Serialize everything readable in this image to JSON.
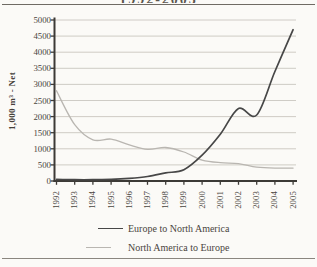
{
  "page": {
    "title_fragment": "1992-2005"
  },
  "chart_data": {
    "type": "line",
    "title_visible_fragment": "1992-2005",
    "ylabel": "1,000 m³ - Net",
    "ylim": [
      0,
      5000
    ],
    "yticks": [
      0,
      500,
      1000,
      1500,
      2000,
      2500,
      3000,
      3500,
      4000,
      4500,
      5000
    ],
    "ytick_labels": [
      "0",
      "500",
      "1000",
      "1500",
      "2000",
      "2500",
      "3000",
      "3500",
      "4000",
      "4500",
      "5000"
    ],
    "x": [
      1992,
      1993,
      1994,
      1995,
      1996,
      1997,
      1998,
      1999,
      2000,
      2001,
      2002,
      2003,
      2004,
      2005
    ],
    "xtick_labels": [
      "1992",
      "1993",
      "1994",
      "1995",
      "1996",
      "1997",
      "1998",
      "1999",
      "2000",
      "2001",
      "2002",
      "2003",
      "2004",
      "2005"
    ],
    "grid": true,
    "legend_position": "bottom",
    "colors": {
      "axis": "#3c3a36",
      "gridline": "#c9c6c0",
      "text": "#4a453e"
    },
    "series": [
      {
        "name": "Europe to North America",
        "color": "#474747",
        "values": [
          50,
          40,
          40,
          50,
          80,
          140,
          250,
          350,
          800,
          1450,
          2250,
          2050,
          3400,
          4700
        ]
      },
      {
        "name": "North America to Europe",
        "color": "#b9b6b1",
        "values": [
          2800,
          1750,
          1280,
          1300,
          1120,
          980,
          1040,
          900,
          650,
          570,
          540,
          430,
          400,
          400
        ]
      }
    ]
  }
}
